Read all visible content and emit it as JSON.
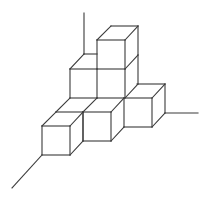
{
  "diagram": {
    "title": "",
    "stroke_color": "#3a3a3a",
    "stroke_width": 1.1,
    "background": "#ffffff",
    "cube_count_visible": 7,
    "axes": [
      {
        "name": "vertical-axis",
        "x1": 84,
        "y1": 54,
        "x2": 84,
        "y2": 13
      },
      {
        "name": "right-axis",
        "x1": 165,
        "y1": 113,
        "x2": 198,
        "y2": 113
      },
      {
        "name": "left-front-axis",
        "x1": 42,
        "y1": 155,
        "x2": 12,
        "y2": 188
      }
    ],
    "cubes": [
      {
        "name": "cube-top-middle",
        "segments": [
          [
            97,
            40,
            125,
            40
          ],
          [
            125,
            40,
            125,
            69
          ],
          [
            97,
            40,
            97,
            69
          ],
          [
            97,
            40,
            111,
            26
          ],
          [
            111,
            26,
            138,
            26
          ],
          [
            125,
            40,
            138,
            26
          ],
          [
            138,
            26,
            138,
            55
          ],
          [
            125,
            69,
            138,
            55
          ]
        ]
      },
      {
        "name": "cube-level1-middle",
        "segments": [
          [
            97,
            69,
            125,
            69
          ],
          [
            125,
            69,
            125,
            98
          ],
          [
            97,
            69,
            97,
            98
          ],
          [
            138,
            55,
            138,
            84
          ],
          [
            125,
            98,
            138,
            84
          ]
        ]
      },
      {
        "name": "cube-level1-left",
        "segments": [
          [
            70,
            69,
            97,
            69
          ],
          [
            70,
            69,
            70,
            98
          ],
          [
            70,
            98,
            97,
            98
          ],
          [
            70,
            69,
            84,
            54
          ],
          [
            84,
            54,
            97,
            54
          ]
        ]
      },
      {
        "name": "cube-level0-right",
        "segments": [
          [
            124,
            98,
            152,
            98
          ],
          [
            152,
            98,
            152,
            127
          ],
          [
            124,
            127,
            152,
            127
          ],
          [
            124,
            98,
            124,
            127
          ],
          [
            137,
            84,
            165,
            84
          ],
          [
            152,
            98,
            165,
            84
          ],
          [
            165,
            84,
            165,
            113
          ],
          [
            152,
            127,
            165,
            113
          ]
        ]
      },
      {
        "name": "cube-level0-middle",
        "segments": [
          [
            83,
            112,
            111,
            112
          ],
          [
            111,
            112,
            111,
            141
          ],
          [
            83,
            141,
            111,
            141
          ],
          [
            83,
            112,
            83,
            141
          ],
          [
            97,
            98,
            124,
            98
          ],
          [
            111,
            112,
            124,
            98
          ],
          [
            111,
            141,
            124,
            127
          ],
          [
            83,
            112,
            97,
            98
          ]
        ]
      },
      {
        "name": "cube-level0-behind-left",
        "segments": [
          [
            56,
            112,
            83,
            112
          ],
          [
            56,
            112,
            70,
            98
          ]
        ]
      },
      {
        "name": "cube-level0-front-left",
        "segments": [
          [
            42,
            126,
            70,
            126
          ],
          [
            70,
            126,
            70,
            155
          ],
          [
            42,
            155,
            70,
            155
          ],
          [
            42,
            126,
            42,
            155
          ],
          [
            42,
            126,
            56,
            112
          ],
          [
            70,
            126,
            83,
            112
          ],
          [
            83,
            112,
            83,
            141
          ],
          [
            70,
            155,
            83,
            141
          ]
        ]
      }
    ]
  }
}
